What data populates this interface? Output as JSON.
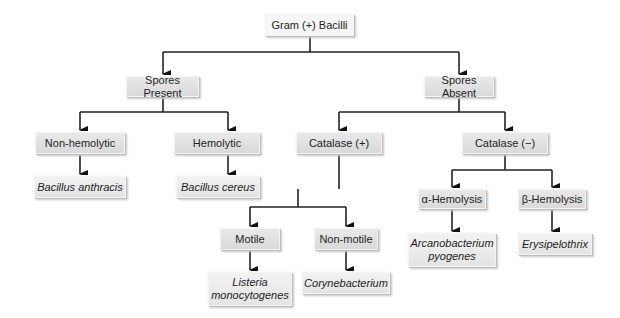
{
  "diagram": {
    "type": "flowchart",
    "root": "Gram (+) Bacilli",
    "nodes": {
      "root": "Gram (+) Bacilli",
      "spores_present": "Spores Present",
      "spores_absent": "Spores Absent",
      "non_hemolytic": "Non-hemolytic",
      "hemolytic": "Hemolytic",
      "catalase_pos": "Catalase (+)",
      "catalase_neg": "Catalase (−)",
      "bacillus_anthracis": "Bacillus anthracis",
      "bacillus_cereus": "Bacillus cereus",
      "motile": "Motile",
      "non_motile": "Non-motile",
      "alpha_hemolysis": "α-Hemolysis",
      "beta_hemolysis": "β-Hemolysis",
      "listeria_l1": "Listeria",
      "listeria_l2": "monocytogenes",
      "corynebacterium": "Corynebacterium",
      "arcanobacterium_l1": "Arcanobacterium",
      "arcanobacterium_l2": "pyogenes",
      "erysipelothrix": "Erysipelothrix"
    },
    "edges": [
      [
        "Gram (+) Bacilli",
        "Spores Present"
      ],
      [
        "Gram (+) Bacilli",
        "Spores Absent"
      ],
      [
        "Spores Present",
        "Non-hemolytic"
      ],
      [
        "Spores Present",
        "Hemolytic"
      ],
      [
        "Non-hemolytic",
        "Bacillus anthracis"
      ],
      [
        "Hemolytic",
        "Bacillus cereus"
      ],
      [
        "Spores Absent",
        "Catalase (+)"
      ],
      [
        "Spores Absent",
        "Catalase (−)"
      ],
      [
        "Catalase (+)",
        "Motile"
      ],
      [
        "Catalase (+)",
        "Non-motile"
      ],
      [
        "Motile",
        "Listeria monocytogenes"
      ],
      [
        "Non-motile",
        "Corynebacterium"
      ],
      [
        "Catalase (−)",
        "α-Hemolysis"
      ],
      [
        "Catalase (−)",
        "β-Hemolysis"
      ],
      [
        "α-Hemolysis",
        "Arcanobacterium pyogenes"
      ],
      [
        "β-Hemolysis",
        "Erysipelothrix"
      ]
    ]
  }
}
